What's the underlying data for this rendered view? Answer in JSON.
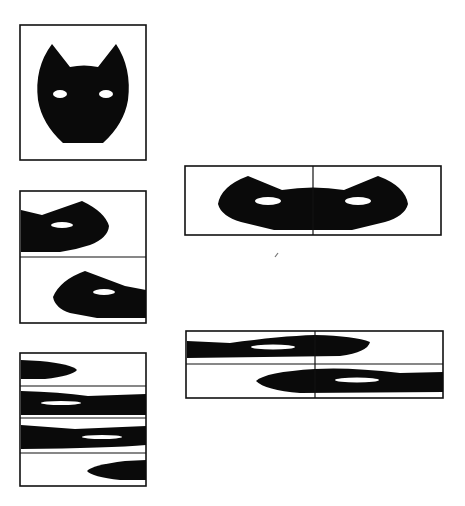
{
  "figure": {
    "colors": {
      "ink": "#0a0a0a",
      "paper": "#ffffff",
      "stroke": "#111111"
    },
    "panels": [
      {
        "id": "panel-1",
        "label": "Whole head",
        "frame": [
          20,
          25,
          126,
          135
        ],
        "segments": 1
      },
      {
        "id": "panel-2",
        "label": "Head split into 2 horizontal halves",
        "frame": [
          20,
          191,
          126,
          132
        ],
        "segments": 2
      },
      {
        "id": "panel-3",
        "label": "Head split into 4 horizontal strips",
        "frame": [
          20,
          353,
          126,
          133
        ],
        "segments": 4
      },
      {
        "id": "panel-4",
        "label": "Two halves rejoined side-by-side (split face)",
        "frame": [
          185,
          166,
          256,
          69
        ],
        "segments": 2
      },
      {
        "id": "panel-5",
        "label": "Four strips arranged in 2x2 grid",
        "frame": [
          186,
          331,
          257,
          67
        ],
        "segments": 4
      }
    ],
    "stray_mark": {
      "x": 276,
      "y": 258
    }
  }
}
